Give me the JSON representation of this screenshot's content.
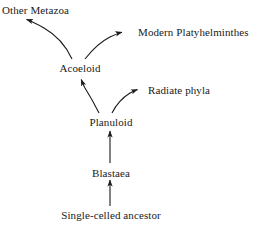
{
  "diagram": {
    "background_color": "#ffffff",
    "line_color": "#1a1a1a",
    "text_color": "#1a1a1a",
    "nodes": [
      {
        "id": "other_metazoa",
        "label": "Other Metazoa"
      },
      {
        "id": "modern_platy",
        "label": "Modern Platyhelminthes"
      },
      {
        "id": "acoeloid",
        "label": "Acoeloid"
      },
      {
        "id": "radiate_phyla",
        "label": "Radiate phyla"
      },
      {
        "id": "planuloid",
        "label": "Planuloid"
      },
      {
        "id": "blastaea",
        "label": "Blastaea"
      },
      {
        "id": "single_celled",
        "label": "Single-celled ancestor"
      }
    ],
    "edges": [
      {
        "from": "acoeloid",
        "to": "other_metazoa",
        "style": "curved"
      },
      {
        "from": "acoeloid",
        "to": "modern_platy",
        "style": "curved"
      },
      {
        "from": "planuloid",
        "to": "acoeloid",
        "style": "curved"
      },
      {
        "from": "planuloid",
        "to": "radiate_phyla",
        "style": "curved"
      },
      {
        "from": "blastaea",
        "to": "planuloid",
        "style": "straight"
      },
      {
        "from": "single_celled",
        "to": "blastaea",
        "style": "straight"
      }
    ]
  }
}
